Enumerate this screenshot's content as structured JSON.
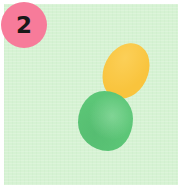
{
  "image": {
    "width": 181,
    "height": 185,
    "page_background": "#ffffff",
    "alt_description": "Annotated photo tile with a pink numbered marker"
  },
  "card": {
    "name": "mint-card",
    "background_color": "#d6f2d3",
    "inset_px": 4
  },
  "badge": {
    "number": "2",
    "background_color": "#f77b9a",
    "text_color": "#181818",
    "diameter_px": 46
  },
  "shapes": [
    {
      "id": "orange-blob",
      "label": "orange oval",
      "color": "#f9c43d",
      "shape": "ellipse",
      "rotation_deg": 26,
      "x": 100,
      "y": 38,
      "width": 44,
      "height": 58
    },
    {
      "id": "green-blob",
      "label": "green blob",
      "color": "#5cc677",
      "shape": "irregular-circle",
      "rotation_deg": 0,
      "x": 74,
      "y": 87,
      "width": 55,
      "height": 60
    }
  ]
}
